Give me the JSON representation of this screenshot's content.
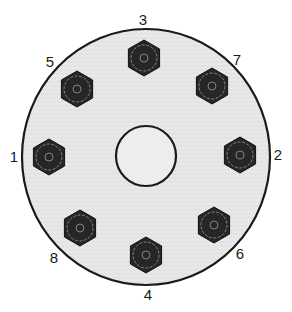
{
  "diagram": {
    "type": "bolt-tightening-sequence",
    "flange": {
      "cx": 146,
      "cy": 157,
      "rx": 124,
      "ry": 128,
      "fill": "#e6e6e6",
      "stroke": "#1a1a1a"
    },
    "center_hole": {
      "cx": 146,
      "cy": 156,
      "r": 30,
      "fill": "#ededed",
      "stroke": "#1a1a1a"
    },
    "bolt_color": "#262626",
    "bolt_ring_color": "#9a9a9a",
    "bolts": [
      {
        "seq": "1",
        "x": 49,
        "y": 157,
        "label_x": 14,
        "label_y": 162
      },
      {
        "seq": "2",
        "x": 240,
        "y": 155,
        "label_x": 278,
        "label_y": 160
      },
      {
        "seq": "3",
        "x": 144,
        "y": 58,
        "label_x": 143,
        "label_y": 25
      },
      {
        "seq": "4",
        "x": 146,
        "y": 255,
        "label_x": 148,
        "label_y": 300
      },
      {
        "seq": "5",
        "x": 77,
        "y": 89,
        "label_x": 50,
        "label_y": 67
      },
      {
        "seq": "6",
        "x": 214,
        "y": 225,
        "label_x": 240,
        "label_y": 259
      },
      {
        "seq": "7",
        "x": 212,
        "y": 86,
        "label_x": 237,
        "label_y": 65
      },
      {
        "seq": "8",
        "x": 80,
        "y": 228,
        "label_x": 54,
        "label_y": 263
      }
    ]
  }
}
